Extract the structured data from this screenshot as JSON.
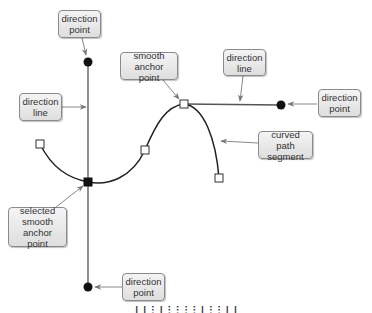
{
  "diagram": {
    "colors": {
      "path": "#222222",
      "direction_line": "#555555",
      "leader_arrow": "#888888",
      "callout_fill_top": "#f4f4f4",
      "callout_fill_bottom": "#dedede",
      "callout_border": "#8a8a8a",
      "callout_text": "#333333"
    },
    "callouts": [
      {
        "id": "top-direction-point",
        "label": "direction\npoint"
      },
      {
        "id": "smooth-anchor-point",
        "label": "smooth\nanchor point"
      },
      {
        "id": "right-direction-line",
        "label": "direction\nline"
      },
      {
        "id": "right-direction-point",
        "label": "direction\npoint"
      },
      {
        "id": "left-direction-line",
        "label": "direction\nline"
      },
      {
        "id": "curved-path-segment",
        "label": "curved path\nsegment"
      },
      {
        "id": "selected-smooth-anchor-point",
        "label": "selected\nsmooth\nanchor point"
      },
      {
        "id": "bottom-direction-point",
        "label": "direction\npoint"
      }
    ],
    "elements": {
      "anchor_points": [
        {
          "name": "left-end-anchor",
          "x": 40,
          "y": 144,
          "selected": false
        },
        {
          "name": "selected-smooth-anchor",
          "x": 88,
          "y": 182,
          "selected": true
        },
        {
          "name": "middle-anchor",
          "x": 145,
          "y": 150,
          "selected": false
        },
        {
          "name": "smooth-anchor",
          "x": 184,
          "y": 104,
          "selected": false
        },
        {
          "name": "right-end-anchor",
          "x": 219,
          "y": 178,
          "selected": false
        }
      ],
      "direction_points": [
        {
          "name": "top-direction-point",
          "x": 88,
          "y": 62
        },
        {
          "name": "bottom-direction-point",
          "x": 88,
          "y": 287
        },
        {
          "name": "right-direction-point",
          "x": 281,
          "y": 105
        }
      ]
    },
    "caption": "(caption text clipped at bottom edge)"
  }
}
